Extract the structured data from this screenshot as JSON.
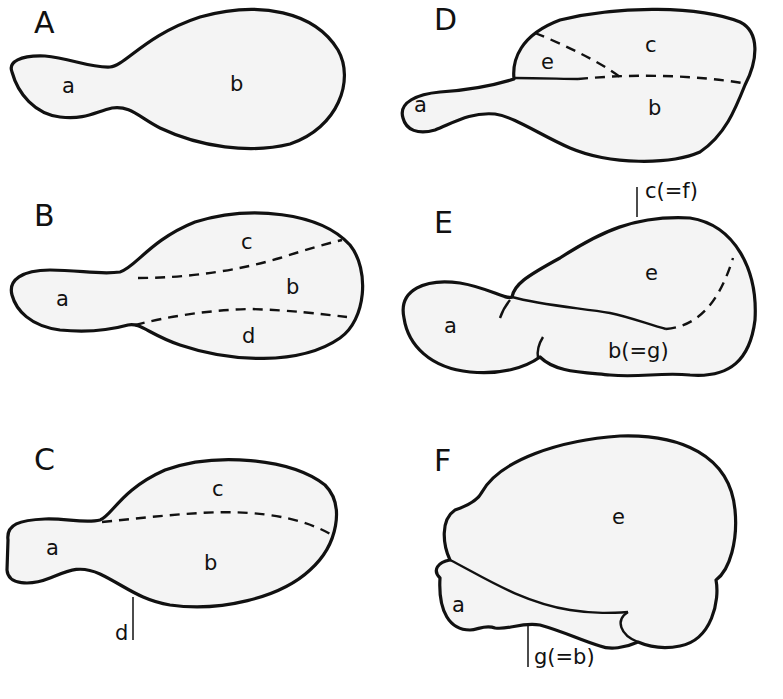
{
  "figure": {
    "fill_color": "#f4f4f4",
    "stroke_color": "#111111"
  },
  "panels": [
    {
      "id": "A",
      "letter": "A",
      "regions": {
        "a": "a",
        "b": "b"
      }
    },
    {
      "id": "B",
      "letter": "B",
      "regions": {
        "a": "a",
        "b": "b",
        "c": "c",
        "d": "d"
      }
    },
    {
      "id": "C",
      "letter": "C",
      "regions": {
        "a": "a",
        "b": "b",
        "c": "c",
        "d": "d"
      }
    },
    {
      "id": "D",
      "letter": "D",
      "regions": {
        "a": "a",
        "b": "b",
        "c": "c",
        "e": "e"
      }
    },
    {
      "id": "E",
      "letter": "E",
      "regions": {
        "a": "a",
        "e": "e",
        "cf": "c(=f)",
        "bg": "b(=g)"
      }
    },
    {
      "id": "F",
      "letter": "F",
      "regions": {
        "a": "a",
        "e": "e",
        "gb": "g(=b)"
      }
    }
  ]
}
